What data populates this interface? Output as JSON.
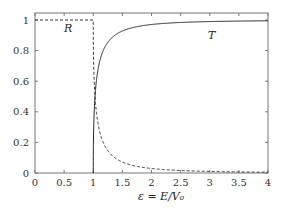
{
  "chart_data": {
    "type": "line",
    "title": "",
    "xlabel": "ε = E/V₀",
    "ylabel": "",
    "xlim": [
      0,
      4
    ],
    "ylim": [
      0,
      1
    ],
    "x_ticks": [
      "0",
      "0.5",
      "1",
      "1.5",
      "2",
      "2.5",
      "3",
      "3.5",
      "4"
    ],
    "y_ticks": [
      "0",
      "0.2",
      "0.4",
      "0.6",
      "0.8",
      "1"
    ],
    "grid": false,
    "legend": "inline labels",
    "series": [
      {
        "name": "R",
        "style": "dashed",
        "x": [
          0,
          0.5,
          1.0,
          1.01,
          1.05,
          1.1,
          1.25,
          1.5,
          2.0,
          2.5,
          3.0,
          3.5,
          4.0
        ],
        "values": [
          1,
          1,
          1,
          0.67,
          0.41,
          0.3,
          0.17,
          0.07,
          0.03,
          0.016,
          0.01,
          0.007,
          0.005
        ]
      },
      {
        "name": "T",
        "style": "solid",
        "x": [
          0,
          0.5,
          1.0,
          1.01,
          1.05,
          1.1,
          1.25,
          1.5,
          2.0,
          2.5,
          3.0,
          3.5,
          4.0
        ],
        "values": [
          0,
          0,
          0,
          0.33,
          0.59,
          0.7,
          0.83,
          0.93,
          0.97,
          0.984,
          0.99,
          0.993,
          0.995
        ]
      }
    ],
    "annotations": [
      {
        "text": "R",
        "x": 0.9,
        "y": 0.96
      },
      {
        "text": "T",
        "x": 3.1,
        "y": 0.86
      }
    ]
  }
}
